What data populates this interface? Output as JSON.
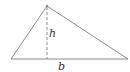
{
  "diagram": {
    "labels": {
      "height": "h",
      "base": "b"
    },
    "vertices": {
      "apex": [
        47,
        6
      ],
      "left": [
        11,
        59
      ],
      "right": [
        128,
        59
      ]
    },
    "colors": {
      "stroke": "#8a8a8a",
      "text": "#333333"
    }
  }
}
